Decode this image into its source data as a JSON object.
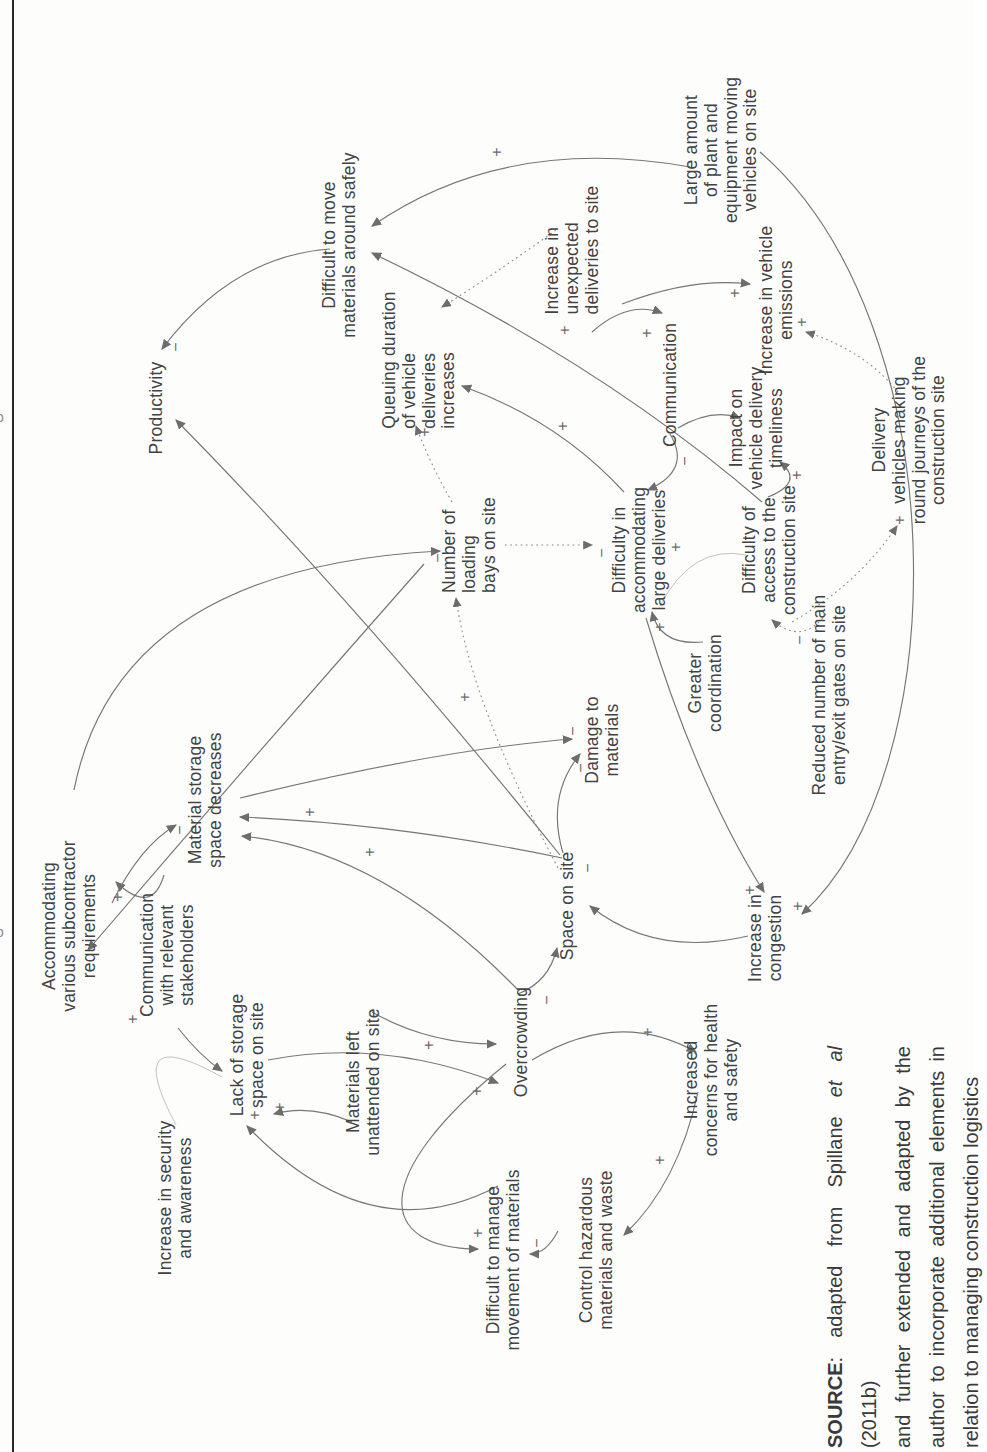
{
  "figure": {
    "colors": {
      "paper": "#fdfdfc",
      "edge": "#767676",
      "edge_dotted": "#8f8f8f",
      "edge_faint": "#c3c3c3",
      "text": "#424242",
      "rule": "#262626"
    },
    "nodes": [
      {
        "id": "productivity",
        "label": "Productivity",
        "x": 1044,
        "y": 157
      },
      {
        "id": "difficult-move",
        "label": "Difficult to move\nmaterials around safely",
        "x": 1207,
        "y": 340
      },
      {
        "id": "queuing-duration",
        "label": "Queuing duration\nof vehicle\ndeliveries\nincreases",
        "x": 1092,
        "y": 420,
        "align": "left"
      },
      {
        "id": "unexpected-deliveries",
        "label": "Increase in\nunexpected\ndeliveries to site",
        "x": 1202,
        "y": 573,
        "align": "left"
      },
      {
        "id": "large-amount-plant",
        "label": "Large amount\nof plant and\nequipment moving\nvehicles on site",
        "x": 1302,
        "y": 722
      },
      {
        "id": "communication",
        "label": "Communication",
        "x": 1067,
        "y": 671
      },
      {
        "id": "vehicle-emissions",
        "label": "Increase in vehicle\nemissions",
        "x": 1152,
        "y": 777
      },
      {
        "id": "impact-timeliness",
        "label": "Impact on\nvehicle delivery\ntimeliness",
        "x": 1024,
        "y": 757
      },
      {
        "id": "delivery-round-journeys",
        "label": "Delivery\nvehicles making\nround journeys of the\nconstruction site",
        "x": 1012,
        "y": 910
      },
      {
        "id": "difficulty-access",
        "label": "Difficulty of\naccess to the\nconstruction site",
        "x": 902,
        "y": 770
      },
      {
        "id": "difficulty-accommodating",
        "label": "Difficulty in\naccommodating\nlarge deliveries",
        "x": 902,
        "y": 640
      },
      {
        "id": "greater-coordination",
        "label": "Greater\ncoordination",
        "x": 769,
        "y": 706
      },
      {
        "id": "reduced-gates",
        "label": "Reduced number of main\nentry/exit gates on site",
        "x": 757,
        "y": 830
      },
      {
        "id": "number-loading-bays",
        "label": "Number of\nloading\nbays on site",
        "x": 907,
        "y": 470,
        "align": "left"
      },
      {
        "id": "damage-materials",
        "label": "Damage to\nmaterials",
        "x": 712,
        "y": 603
      },
      {
        "id": "space-on-site",
        "label": "Space on site",
        "x": 546,
        "y": 568
      },
      {
        "id": "overcrowding",
        "label": "Overcrowding",
        "x": 410,
        "y": 522
      },
      {
        "id": "increase-congestion",
        "label": "Increase in\ncongestion",
        "x": 514,
        "y": 766
      },
      {
        "id": "material-storage",
        "label": "Material storage\nspace decreases",
        "x": 652,
        "y": 206
      },
      {
        "id": "accommodating-subcontractor",
        "label": "Accommodating\nvarious subcontractor\nrequirements",
        "x": 526,
        "y": 70
      },
      {
        "id": "comm-stakeholders",
        "label": "Communication\nwith relevant\nstakeholders",
        "x": 497,
        "y": 168
      },
      {
        "id": "lack-storage",
        "label": "Lack of storage\nspace on site",
        "x": 397,
        "y": 248
      },
      {
        "id": "security-awareness",
        "label": "Increase in security\nand awareness",
        "x": 254,
        "y": 176
      },
      {
        "id": "materials-left",
        "label": "Materials left\nunattended on site",
        "x": 370,
        "y": 364
      },
      {
        "id": "difficult-manage",
        "label": "Difficult to manage\nmovement of materials",
        "x": 192,
        "y": 504
      },
      {
        "id": "control-hazardous",
        "label": "Control hazardous\nmaterials and waste",
        "x": 202,
        "y": 597
      },
      {
        "id": "increased-concerns",
        "label": "Increased\nconcerns for health\nand safety",
        "x": 372,
        "y": 712
      }
    ],
    "edges": [
      {
        "from": "large-amount-plant",
        "to": "difficult-move",
        "style": "solid",
        "arrow": true,
        "path": "M 1285,690 Q 1318,505 1226,372"
      },
      {
        "from": "difficulty-access",
        "to": "difficult-move",
        "style": "solid",
        "arrow": true,
        "path": "M 950,762 Q 1090,600 1199,372"
      },
      {
        "from": "difficult-move",
        "to": "productivity",
        "style": "solid",
        "arrow": true,
        "path": "M 1203,330 Q 1196,232 1103,162"
      },
      {
        "from": "space-on-site",
        "to": "productivity",
        "style": "solid",
        "arrow": true,
        "path": "M 597,560 Q 845,360 1032,176"
      },
      {
        "from": "unexpected-deliveries",
        "to": "queuing-duration",
        "style": "dotted",
        "arrow": true,
        "path": "M 1222,556 Q 1180,498 1145,442"
      },
      {
        "from": "unexpected-deliveries",
        "to": "communication",
        "style": "solid",
        "arrow": true,
        "path": "M 1120,592 Q 1152,628 1139,662"
      },
      {
        "from": "unexpected-deliveries",
        "to": "vehicle-emissions",
        "style": "solid",
        "arrow": true,
        "path": "M 1148,622 Q 1175,692 1168,750"
      },
      {
        "from": "communication",
        "to": "impact-timeliness",
        "style": "solid",
        "arrow": true,
        "path": "M 1024,678 Q 1044,712 1034,740"
      },
      {
        "from": "communication",
        "to": "difficulty-accommodating",
        "style": "solid",
        "arrow": true,
        "path": "M 1018,670 Q 982,692 962,648"
      },
      {
        "from": "difficulty-access",
        "to": "impact-timeliness",
        "style": "solid",
        "arrow": true,
        "path": "M 955,768 Q 970,805 990,780"
      },
      {
        "from": "reduced-gates",
        "to": "difficulty-access",
        "style": "dotted",
        "arrow": true,
        "path": "M 838,826 Q 806,802 832,772"
      },
      {
        "from": "difficulty-access",
        "to": "delivery-round-journeys",
        "style": "dotted",
        "arrow": true,
        "path": "M 830,792 Q 868,858 926,897"
      },
      {
        "from": "delivery-round-journeys",
        "to": "vehicle-emissions",
        "style": "dotted",
        "arrow": true,
        "path": "M 1060,898 Q 1102,864 1120,806"
      },
      {
        "from": "greater-coordination",
        "to": "difficulty-accommodating",
        "style": "solid",
        "arrow": true,
        "path": "M 810,703 Q 806,660 840,652"
      },
      {
        "from": "difficulty-accommodating",
        "to": "queuing-duration",
        "style": "solid",
        "arrow": true,
        "path": "M 960,624 Q 1032,558 1066,462"
      },
      {
        "from": "number-loading-bays",
        "to": "difficulty-accommodating",
        "style": "dotted",
        "arrow": true,
        "path": "M 907,505 L 907,592"
      },
      {
        "from": "number-loading-bays",
        "to": "queuing-duration",
        "style": "dotted",
        "arrow": true,
        "path": "M 950,452 Q 988,430 1026,416"
      },
      {
        "from": "accommodating-subcontractor",
        "to": "number-loading-bays",
        "style": "solid",
        "arrow": true,
        "path": "M 662,74 Q 884,118 901,440"
      },
      {
        "from": "number-loading-bays",
        "to": "accommodating-subcontractor",
        "style": "solid",
        "arrow": true,
        "path": "M 888,424 Q 700,258 502,88"
      },
      {
        "from": "comm-stakeholders",
        "to": "accommodating-subcontractor",
        "style": "solid",
        "arrow": true,
        "path": "M 577,164 Q 536,152 570,116"
      },
      {
        "from": "accommodating-subcontractor",
        "to": "material-storage",
        "style": "solid",
        "arrow": true,
        "path": "M 549,112 Q 606,140 627,176"
      },
      {
        "from": "space-on-site",
        "to": "material-storage",
        "style": "solid",
        "arrow": true,
        "path": "M 594,562 Q 628,400 635,240"
      },
      {
        "from": "overcrowding",
        "to": "material-storage",
        "style": "solid",
        "arrow": true,
        "path": "M 462,518 Q 602,382 616,242"
      },
      {
        "from": "material-storage",
        "to": "damage-materials",
        "style": "solid",
        "arrow": true,
        "path": "M 654,240 Q 702,436 713,572"
      },
      {
        "from": "space-on-site",
        "to": "damage-materials",
        "style": "solid",
        "arrow": true,
        "path": "M 599,563 Q 656,546 698,580"
      },
      {
        "from": "overcrowding",
        "to": "space-on-site",
        "style": "solid",
        "arrow": true,
        "path": "M 458,518 Q 470,549 504,557"
      },
      {
        "from": "increase-congestion",
        "to": "space-on-site",
        "style": "solid",
        "arrow": true,
        "path": "M 516,748 Q 494,655 546,590"
      },
      {
        "from": "large-amount-plant",
        "to": "increase-congestion",
        "style": "solid",
        "arrow": true,
        "path": "M 1300,760 C 1130,956 680,958 538,802"
      },
      {
        "from": "difficulty-accommodating",
        "to": "increase-congestion",
        "style": "solid",
        "arrow": true,
        "path": "M 834,646 Q 668,696 560,764"
      },
      {
        "from": "materials-left",
        "to": "overcrowding",
        "style": "solid",
        "arrow": true,
        "path": "M 440,372 Q 408,428 408,496"
      },
      {
        "from": "materials-left",
        "to": "lack-storage",
        "style": "solid",
        "arrow": true,
        "path": "M 330,352 Q 348,310 338,274"
      },
      {
        "from": "security-awareness",
        "to": "lack-storage",
        "style": "faint",
        "arrow": false,
        "path": "M 327,176 Q 432,120 375,222"
      },
      {
        "from": "comm-stakeholders",
        "to": "lack-storage",
        "style": "solid",
        "arrow": true,
        "path": "M 424,178 Q 396,200 381,222"
      },
      {
        "from": "difficult-manage",
        "to": "lack-storage",
        "style": "solid",
        "arrow": true,
        "path": "M 266,498 Q 198,370 326,247"
      },
      {
        "from": "overcrowding",
        "to": "difficult-manage",
        "style": "solid",
        "arrow": true,
        "path": "M 388,506 C 276,368 204,376 203,478"
      },
      {
        "from": "control-hazardous",
        "to": "difficult-manage",
        "style": "solid",
        "arrow": true,
        "path": "M 221,558 Q 198,546 198,530"
      },
      {
        "from": "increased-concerns",
        "to": "control-hazardous",
        "style": "solid",
        "arrow": true,
        "path": "M 360,698 Q 268,678 217,624"
      },
      {
        "from": "overcrowding",
        "to": "increased-concerns",
        "style": "solid",
        "arrow": true,
        "path": "M 392,532 Q 444,618 400,696"
      },
      {
        "from": "lack-storage",
        "to": "overcrowding",
        "style": "solid",
        "arrow": true,
        "path": "M 392,268 Q 414,382 369,498"
      },
      {
        "from": "difficulty-access",
        "to": "difficulty-accommodating",
        "style": "faint",
        "arrow": false,
        "path": "M 897,746 Q 908,692 846,660"
      },
      {
        "from": "space-on-site",
        "to": "number-loading-bays",
        "style": "dotted",
        "arrow": true,
        "path": "M 584,558 Q 752,470 854,456"
      }
    ],
    "signs": [
      {
        "text": "+",
        "x": 1300,
        "y": 497
      },
      {
        "text": "+",
        "x": 1122,
        "y": 565
      },
      {
        "text": "−",
        "x": 1105,
        "y": 176
      },
      {
        "text": "+",
        "x": 1119,
        "y": 647
      },
      {
        "text": "+",
        "x": 1159,
        "y": 735
      },
      {
        "text": "−",
        "x": 991,
        "y": 685
      },
      {
        "text": "+",
        "x": 977,
        "y": 797
      },
      {
        "text": "−",
        "x": 812,
        "y": 800
      },
      {
        "text": "+",
        "x": 932,
        "y": 900
      },
      {
        "text": "+",
        "x": 1130,
        "y": 802
      },
      {
        "text": "+",
        "x": 825,
        "y": 660
      },
      {
        "text": "+",
        "x": 1026,
        "y": 563
      },
      {
        "text": "−",
        "x": 899,
        "y": 602
      },
      {
        "text": "+",
        "x": 1020,
        "y": 425
      },
      {
        "text": "−",
        "x": 894,
        "y": 438
      },
      {
        "text": "+",
        "x": 507,
        "y": 92
      },
      {
        "text": "+",
        "x": 555,
        "y": 118
      },
      {
        "text": "−",
        "x": 622,
        "y": 180
      },
      {
        "text": "+",
        "x": 640,
        "y": 310
      },
      {
        "text": "+",
        "x": 600,
        "y": 370
      },
      {
        "text": "−",
        "x": 721,
        "y": 573
      },
      {
        "text": "−",
        "x": 684,
        "y": 581
      },
      {
        "text": "−",
        "x": 452,
        "y": 547
      },
      {
        "text": "−",
        "x": 584,
        "y": 588
      },
      {
        "text": "+",
        "x": 546,
        "y": 798
      },
      {
        "text": "+",
        "x": 562,
        "y": 750
      },
      {
        "text": "+",
        "x": 407,
        "y": 429
      },
      {
        "text": "+",
        "x": 345,
        "y": 280
      },
      {
        "text": "+",
        "x": 337,
        "y": 255
      },
      {
        "text": "+",
        "x": 433,
        "y": 133
      },
      {
        "text": "+",
        "x": 219,
        "y": 478
      },
      {
        "text": "−",
        "x": 209,
        "y": 537
      },
      {
        "text": "+",
        "x": 292,
        "y": 660
      },
      {
        "text": "+",
        "x": 420,
        "y": 648
      },
      {
        "text": "+",
        "x": 361,
        "y": 477
      },
      {
        "text": "+",
        "x": 905,
        "y": 676
      },
      {
        "text": "+",
        "x": 755,
        "y": 465
      }
    ],
    "source_note": {
      "prefix": "SOURCE",
      "l1a": ": adapted from Spillane ",
      "l1_italic": "et al",
      "l1b": " (2011b)",
      "line2": "and further extended and adapted by the",
      "line3": "author to incorporate additional elements in",
      "line4": "relation to managing construction logistics",
      "x": 4,
      "y": 818,
      "width": 402
    },
    "marks": [
      {
        "text": "o",
        "x": -4,
        "y": 410
      },
      {
        "text": "o",
        "x": -4,
        "y": 925
      }
    ]
  }
}
